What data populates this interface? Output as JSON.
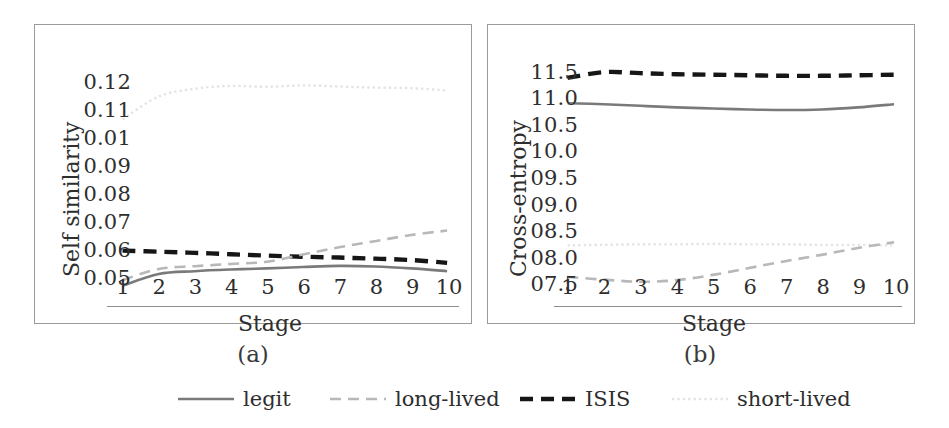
{
  "figure": {
    "panels": [
      {
        "id": "a",
        "caption": "(a)"
      },
      {
        "id": "b",
        "caption": "(b)"
      }
    ]
  },
  "legend": {
    "position": "bottom-center",
    "items": [
      {
        "label": "legit",
        "color": "#7a7a7a",
        "style": "solid"
      },
      {
        "label": "long-lived",
        "color": "#b8b8b8",
        "style": "dashed"
      },
      {
        "label": "ISIS",
        "color": "#161616",
        "style": "dashed-bold"
      },
      {
        "label": "short-lived",
        "color": "#e2e2e2",
        "style": "dotted"
      }
    ]
  },
  "chart_data": [
    {
      "type": "line",
      "panel": "a",
      "title": "",
      "subtitle": "(a)",
      "xlabel": "Stage",
      "ylabel": "Self similarity",
      "x": [
        1,
        2,
        3,
        4,
        5,
        6,
        7,
        8,
        9,
        10
      ],
      "xticklabels": [
        "1",
        "2",
        "3",
        "4",
        "5",
        "6",
        "7",
        "8",
        "9",
        "10"
      ],
      "yticklabels": [
        "0.12",
        "0.11",
        "0.01",
        "0.09",
        "0.08",
        "0.07",
        "0.06",
        "0.05"
      ],
      "ytickvalues": [
        0.12,
        0.11,
        0.1,
        0.09,
        0.08,
        0.07,
        0.06,
        0.05
      ],
      "ylim": [
        0.045,
        0.125
      ],
      "xlim": [
        1,
        10
      ],
      "grid": false,
      "legend_position": "below-figure",
      "series": [
        {
          "name": "short-lived",
          "color": "#e2e2e2",
          "style": "dotted",
          "values": [
            0.1068,
            0.115,
            0.1178,
            0.1188,
            0.1185,
            0.119,
            0.1186,
            0.1182,
            0.118,
            0.1172
          ]
        },
        {
          "name": "ISIS",
          "color": "#161616",
          "style": "dashed-bold",
          "values": [
            0.0596,
            0.0592,
            0.0588,
            0.0583,
            0.0578,
            0.0574,
            0.0571,
            0.0567,
            0.0562,
            0.0552
          ]
        },
        {
          "name": "long-lived",
          "color": "#b8b8b8",
          "style": "dashed",
          "values": [
            0.049,
            0.053,
            0.054,
            0.0548,
            0.0556,
            0.0582,
            0.0608,
            0.063,
            0.0652,
            0.0668
          ]
        },
        {
          "name": "legit",
          "color": "#7a7a7a",
          "style": "solid",
          "values": [
            0.047,
            0.0512,
            0.0522,
            0.0528,
            0.0532,
            0.0537,
            0.0541,
            0.0539,
            0.0532,
            0.0522
          ]
        }
      ]
    },
    {
      "type": "line",
      "panel": "b",
      "title": "",
      "subtitle": "(b)",
      "xlabel": "Stage",
      "ylabel": "Cross-entropy",
      "x": [
        1,
        2,
        3,
        4,
        5,
        6,
        7,
        8,
        9,
        10
      ],
      "xticklabels": [
        "1",
        "2",
        "3",
        "4",
        "5",
        "6",
        "7",
        "8",
        "9",
        "10"
      ],
      "yticklabels": [
        "11.5",
        "11.0",
        "10.5",
        "10.0",
        "09.5",
        "09.0",
        "08.5",
        "08.0",
        "07.5"
      ],
      "ytickvalues": [
        11.5,
        11.0,
        10.5,
        10.0,
        9.5,
        9.0,
        8.5,
        8.0,
        7.5
      ],
      "ylim": [
        7.35,
        11.65
      ],
      "xlim": [
        1,
        10
      ],
      "grid": false,
      "legend_position": "below-figure",
      "series": [
        {
          "name": "ISIS",
          "color": "#161616",
          "style": "dashed-bold",
          "values": [
            11.4,
            11.51,
            11.49,
            11.47,
            11.46,
            11.45,
            11.44,
            11.44,
            11.45,
            11.46
          ]
        },
        {
          "name": "legit",
          "color": "#7a7a7a",
          "style": "solid",
          "values": [
            10.92,
            10.9,
            10.87,
            10.84,
            10.82,
            10.8,
            10.79,
            10.8,
            10.84,
            10.9
          ]
        },
        {
          "name": "short-lived",
          "color": "#e2e2e2",
          "style": "dotted",
          "values": [
            8.22,
            8.23,
            8.24,
            8.24,
            8.25,
            8.24,
            8.24,
            8.23,
            8.23,
            8.22
          ]
        },
        {
          "name": "long-lived",
          "color": "#b8b8b8",
          "style": "dashed",
          "values": [
            7.62,
            7.57,
            7.53,
            7.56,
            7.66,
            7.79,
            7.92,
            8.04,
            8.17,
            8.28
          ]
        }
      ]
    }
  ]
}
